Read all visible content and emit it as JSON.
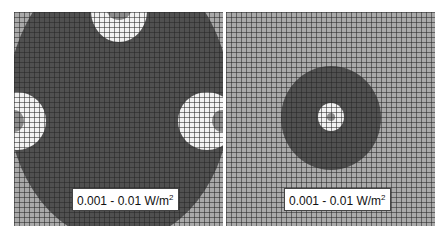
{
  "colors": {
    "background": "#a9a9a9",
    "dark_zone": "#505050",
    "light_zone": "#f2f2f2",
    "core": "#8c8c8c"
  },
  "panels": [
    {
      "name": "left",
      "label": {
        "text": "0.001 - 0.01 W/m",
        "sup": "2"
      }
    },
    {
      "name": "right",
      "label": {
        "text": "0.001 - 0.01 W/m",
        "sup": "2"
      }
    }
  ]
}
